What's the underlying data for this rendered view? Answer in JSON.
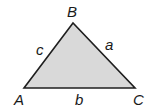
{
  "diagram": {
    "type": "triangle",
    "fill_color": "#d9d9d9",
    "stroke_color": "#1f1f1f",
    "vertices": {
      "A": "A",
      "B": "B",
      "C": "C"
    },
    "sides": {
      "a": "a",
      "b": "b",
      "c": "c"
    }
  }
}
